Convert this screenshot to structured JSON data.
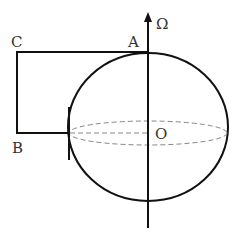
{
  "diagram": {
    "labels": {
      "omega": "Ω",
      "a": "A",
      "b": "B",
      "c": "C",
      "o": "O"
    },
    "colors": {
      "stroke": "#111111",
      "dashed": "#888888",
      "text": "#333333"
    }
  }
}
